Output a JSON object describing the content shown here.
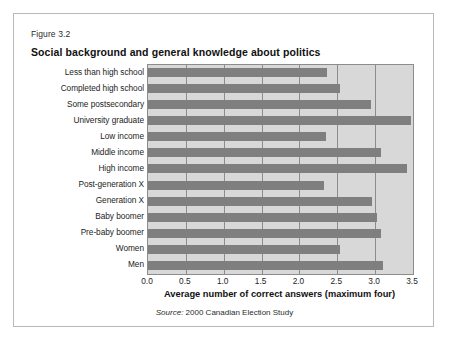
{
  "figure": {
    "number": "Figure 3.2",
    "title": "Social background and general knowledge about politics",
    "source_word": "Source:",
    "source_text": " 2000 Canadian Election Study"
  },
  "colors": {
    "bar": "#7f7f7f",
    "plot_background": "#d8d8d8",
    "gridline": "#8c8c8c",
    "frame": "#b9b9b9"
  },
  "chart_data": {
    "type": "bar",
    "orientation": "horizontal",
    "title": "Social background and general knowledge about politics",
    "xlabel": "Average number of correct answers (maximum four)",
    "ylabel": "",
    "xlim": [
      0.0,
      3.5
    ],
    "xticks": [
      "0.0",
      "0.5",
      "1.0",
      "1.5",
      "2.0",
      "2.5",
      "3.0",
      "3.5"
    ],
    "xtick_values": [
      0.0,
      0.5,
      1.0,
      1.5,
      2.0,
      2.5,
      3.0,
      3.5
    ],
    "grid": true,
    "legend": "none",
    "categories": [
      "Less than high school",
      "Completed high school",
      "Some postsecondary",
      "University graduate",
      "Low income",
      "Middle income",
      "High income",
      "Post-generation X",
      "Generation X",
      "Baby boomer",
      "Pre-baby boomer",
      "Women",
      "Men"
    ],
    "values": [
      2.36,
      2.53,
      2.94,
      3.48,
      2.35,
      3.08,
      3.42,
      2.33,
      2.96,
      3.02,
      3.08,
      2.53,
      3.11
    ]
  }
}
